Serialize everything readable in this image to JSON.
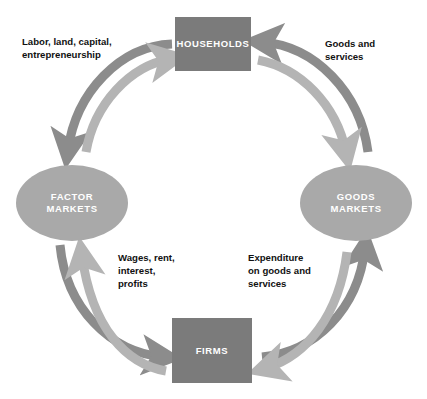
{
  "diagram": {
    "colors": {
      "background": "#ffffff",
      "box_fill": "#7b7b7b",
      "ellipse_fill": "#a9a9a9",
      "outer_flow_arrow": "#8c8c8c",
      "inner_flow_arrow": "#b4b4b4",
      "node_label_text": "#ffffff",
      "flow_label_text": "#111111"
    },
    "nodes": {
      "households": {
        "label": "HOUSEHOLDS",
        "shape": "rectangle"
      },
      "firms": {
        "label": "FIRMS",
        "shape": "rectangle"
      },
      "factor_markets": {
        "label": "FACTOR\nMARKETS",
        "shape": "ellipse"
      },
      "goods_markets": {
        "label": "GOODS\nMARKETS",
        "shape": "ellipse"
      }
    },
    "flows": [
      {
        "id": "labor",
        "label": "Labor, land, capital,\nentrepreneurship",
        "from": "households",
        "to": "factor_markets",
        "ring": "outer",
        "direction": "counterclockwise"
      },
      {
        "id": "goods-services",
        "label": "Goods  and\nservices",
        "from": "goods_markets",
        "to": "households",
        "ring": "outer",
        "direction": "counterclockwise"
      },
      {
        "id": "wages",
        "label": "Wages, rent,\ninterest,\nprofits",
        "from": "firms",
        "to": "factor_markets",
        "ring": "inner",
        "direction": "clockwise"
      },
      {
        "id": "expenditure",
        "label": "Expenditure\non goods and\nservices",
        "from": "firms",
        "to": "goods_markets",
        "ring": "outer",
        "direction": "counterclockwise"
      }
    ]
  }
}
